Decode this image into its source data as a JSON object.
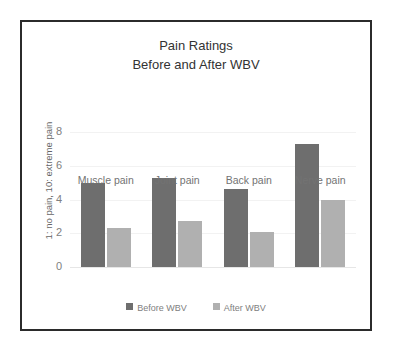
{
  "figure": {
    "border_color": "#2b2b2b",
    "background": "#ffffff"
  },
  "chart_data": {
    "type": "bar",
    "title": "Pain Ratings Before and After WBV",
    "title_lines": [
      "Pain Ratings",
      "Before and After WBV"
    ],
    "xlabel": "",
    "ylabel": "1: no pain, 10: extreme pain",
    "categories": [
      "Muscle pain",
      "Joint pain",
      "Back pain",
      "Nerve pain"
    ],
    "series": [
      {
        "name": "Before WBV",
        "color": "#6e6e6e",
        "values": [
          5.0,
          5.3,
          4.6,
          7.3
        ]
      },
      {
        "name": "After WBV",
        "color": "#b0b0b0",
        "values": [
          2.3,
          2.7,
          2.1,
          4.0
        ]
      }
    ],
    "ylim": [
      0,
      8.6
    ],
    "yticks": [
      0,
      2,
      4,
      6,
      8
    ],
    "ytick_labels": [
      "0",
      "2",
      "4",
      "6",
      "8"
    ],
    "grid": true,
    "grid_color": "#f2f2f2",
    "legend_position": "bottom",
    "legend_entries": [
      "Before WBV",
      "After WBV"
    ]
  }
}
